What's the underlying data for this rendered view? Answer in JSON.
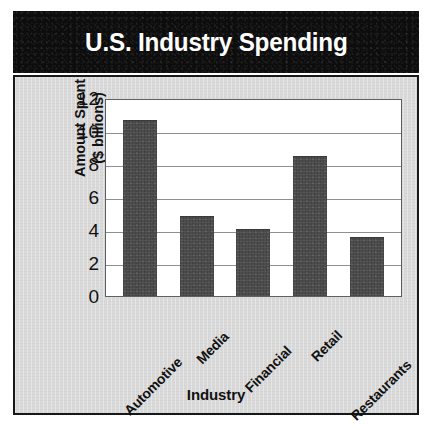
{
  "title": "U.S. Industry Spending",
  "colors": {
    "banner_bg": "#0d0d0d",
    "banner_text": "#ffffff",
    "chart_bg": "#d9d9d9",
    "plot_bg": "#ffffff",
    "bar_fill": "#4b4b4b",
    "gridline": "#8d9093",
    "border": "#16181a",
    "text": "#111111"
  },
  "chart_data": {
    "type": "bar",
    "title": "U.S. Industry Spending",
    "xlabel": "Industry",
    "ylabel": "Amount Spent ($ billions)",
    "ylabel_line1": "Amount Spent",
    "ylabel_line2": "($ billions)",
    "categories": [
      "Automotive",
      "Media",
      "Financial",
      "Retail",
      "Restaurants"
    ],
    "values": [
      10.6,
      4.8,
      4.0,
      8.4,
      3.5
    ],
    "ylim": [
      0,
      12
    ],
    "ytick_step": 2,
    "yticks": [
      12,
      10,
      8,
      6,
      4,
      2,
      0
    ],
    "ytick_labels": [
      "12",
      "10",
      "8",
      "6",
      "4",
      "2",
      "0"
    ],
    "grid": true,
    "grid_axis": "y",
    "legend": false,
    "legend_position": "none",
    "xtick_rotation": -45,
    "bar_count": 5
  }
}
